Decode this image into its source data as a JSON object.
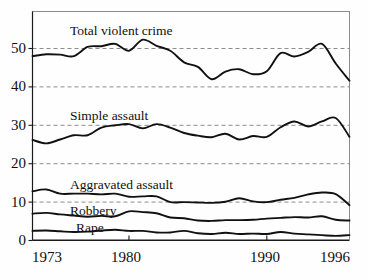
{
  "chart_data": {
    "type": "line",
    "title": "",
    "xlabel": "",
    "ylabel": "",
    "xlim": [
      1973,
      1996
    ],
    "ylim": [
      0,
      55
    ],
    "grid": true,
    "grid_axis": "y",
    "legend_position": "inline-labels",
    "x_ticks": [
      "1973",
      "1980",
      "1990",
      "1996"
    ],
    "x_tick_values": [
      1973,
      1980,
      1990,
      1996
    ],
    "y_ticks": [
      "0",
      "10",
      "20",
      "30",
      "40",
      "50"
    ],
    "y_tick_values": [
      0,
      10,
      20,
      30,
      40,
      50
    ],
    "x": [
      1973,
      1974,
      1975,
      1976,
      1977,
      1978,
      1979,
      1980,
      1981,
      1982,
      1983,
      1984,
      1985,
      1986,
      1987,
      1988,
      1989,
      1990,
      1991,
      1992,
      1993,
      1994,
      1995,
      1996
    ],
    "series": [
      {
        "name": "Total violent crime",
        "label": "Total violent crime",
        "color": "#111111",
        "values": [
          48.0,
          48.5,
          48.4,
          48.0,
          50.4,
          50.6,
          51.2,
          49.4,
          52.3,
          50.7,
          49.4,
          46.4,
          45.2,
          42.0,
          44.0,
          44.6,
          43.3,
          44.1,
          48.8,
          47.9,
          49.1,
          51.2,
          46.1,
          41.6
        ]
      },
      {
        "name": "Simple assault",
        "label": "Simple assault",
        "color": "#111111",
        "values": [
          26.2,
          25.3,
          26.3,
          27.4,
          27.4,
          29.4,
          30.0,
          30.3,
          29.2,
          30.3,
          29.4,
          28.0,
          27.3,
          26.9,
          27.8,
          26.3,
          27.2,
          27.0,
          29.5,
          31.0,
          29.7,
          31.0,
          31.9,
          27.0
        ]
      },
      {
        "name": "Aggravated assault",
        "label": "Aggravated assault",
        "color": "#111111",
        "values": [
          12.8,
          13.3,
          12.2,
          12.2,
          12.2,
          12.0,
          12.2,
          11.4,
          11.5,
          11.5,
          10.0,
          10.0,
          9.9,
          9.8,
          10.1,
          11.0,
          10.2,
          10.0,
          10.6,
          11.1,
          12.0,
          12.5,
          12.1,
          9.2
        ]
      },
      {
        "name": "Robbery",
        "label": "Robbery",
        "color": "#111111",
        "values": [
          7.0,
          7.2,
          6.8,
          6.5,
          6.2,
          6.4,
          6.3,
          7.6,
          7.4,
          7.1,
          6.0,
          5.8,
          5.2,
          5.1,
          5.3,
          5.3,
          5.4,
          5.7,
          5.9,
          6.1,
          6.0,
          6.3,
          5.4,
          5.2
        ]
      },
      {
        "name": "Rape",
        "label": "Rape",
        "color": "#111111",
        "values": [
          2.5,
          2.6,
          2.4,
          2.2,
          2.3,
          2.6,
          2.8,
          2.5,
          2.5,
          2.1,
          2.1,
          2.5,
          1.9,
          1.7,
          2.0,
          1.7,
          1.8,
          1.7,
          2.2,
          1.8,
          1.6,
          1.4,
          1.2,
          1.4
        ]
      }
    ],
    "annotations": [
      {
        "text": "Total violent crime",
        "x": 1976.2,
        "y": 57.0
      },
      {
        "text": "Simple assault",
        "x": 1975.8,
        "y": 34.5
      },
      {
        "text": "Aggravated assault",
        "x": 1976.2,
        "y": 16.3
      },
      {
        "text": "Robbery",
        "x": 1976.0,
        "y": 9.0
      },
      {
        "text": "Rape",
        "x": 1977.0,
        "y": 4.6
      }
    ]
  },
  "axis": {
    "y_tick_0": "0",
    "y_tick_10": "10",
    "y_tick_20": "20",
    "y_tick_30": "30",
    "y_tick_40": "40",
    "y_tick_50": "50",
    "x_tick_1973": "1973",
    "x_tick_1980": "1980",
    "x_tick_1990": "1990",
    "x_tick_1996": "1996"
  },
  "labels": {
    "total_violent_crime": "Total violent crime",
    "simple_assault": "Simple assault",
    "aggravated_assault": "Aggravated assault",
    "robbery": "Robbery",
    "rape": "Rape"
  },
  "colors": {
    "curve": "#111111",
    "grid": "#8d8d8d",
    "frame": "#8b8b8b",
    "axis": "#1a1a1a",
    "background": "#fefefe"
  }
}
